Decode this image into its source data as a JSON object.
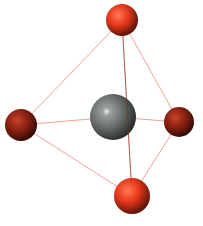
{
  "diagram": {
    "geometry": "tetrahedral",
    "colors": {
      "background": "#ffffff",
      "bond": "#e8a59a",
      "central_atom": "#5f6461",
      "ligand_bright": "#e8391a",
      "ligand_dark": "#9a2414"
    },
    "atoms": [
      {
        "id": "top",
        "role": "ligand",
        "shade": "bright"
      },
      {
        "id": "left",
        "role": "ligand",
        "shade": "dark"
      },
      {
        "id": "right",
        "role": "ligand",
        "shade": "dark"
      },
      {
        "id": "bottom",
        "role": "ligand",
        "shade": "bright"
      },
      {
        "id": "center",
        "role": "central"
      }
    ],
    "bonds": [
      [
        "top",
        "left"
      ],
      [
        "top",
        "right"
      ],
      [
        "top",
        "bottom"
      ],
      [
        "left",
        "center"
      ],
      [
        "center",
        "right"
      ],
      [
        "left",
        "bottom"
      ],
      [
        "right",
        "bottom"
      ]
    ]
  }
}
